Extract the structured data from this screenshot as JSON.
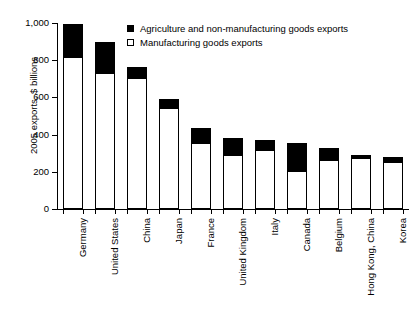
{
  "chart_data": {
    "type": "bar",
    "title": "",
    "xlabel": "",
    "ylabel": "2005 exports, $ billions",
    "ylim": [
      0,
      1000
    ],
    "yticks": [
      "0",
      "200",
      "400",
      "600",
      "800",
      "1,000"
    ],
    "ytick_values": [
      0,
      200,
      400,
      600,
      800,
      1000
    ],
    "grid": false,
    "stacked": true,
    "legend_position": "top-center",
    "categories": [
      "Germany",
      "United States",
      "China",
      "Japan",
      "France",
      "United Kingdom",
      "Italy",
      "Canada",
      "Belgium",
      "Hong Kong, China",
      "Korea"
    ],
    "series": [
      {
        "name": "Manufacturing goods exports",
        "color": "#ffffff",
        "values": [
          815,
          730,
          705,
          545,
          355,
          290,
          315,
          205,
          265,
          275,
          255
        ]
      },
      {
        "name": "Agriculture and non-manufacturing goods exports",
        "color": "#000000",
        "values": [
          180,
          170,
          60,
          45,
          80,
          90,
          55,
          150,
          65,
          15,
          25
        ]
      }
    ],
    "totals": [
      995,
      900,
      765,
      590,
      435,
      380,
      370,
      355,
      330,
      290,
      280
    ]
  },
  "legend": {
    "items": [
      {
        "label": "Agriculture and non-manufacturing goods exports",
        "swatch": "filled"
      },
      {
        "label": "Manufacturing goods exports",
        "swatch": "open"
      }
    ]
  }
}
